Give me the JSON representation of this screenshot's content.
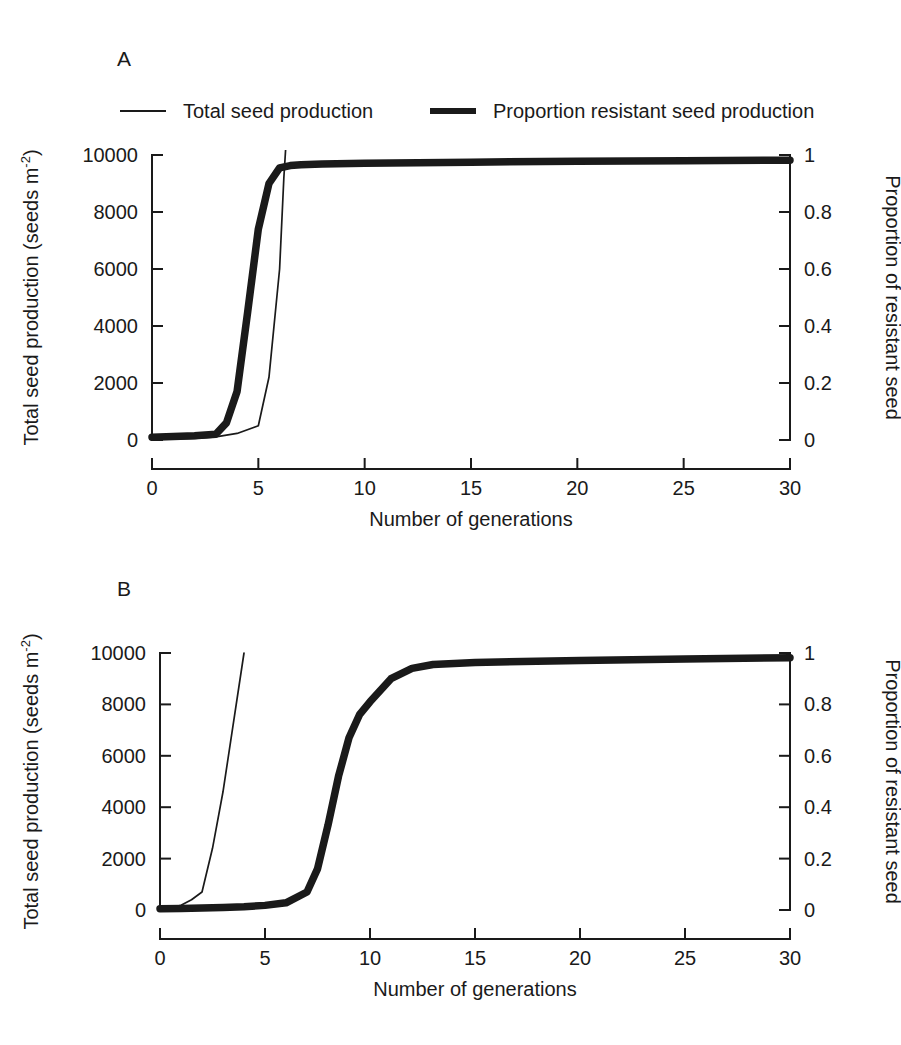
{
  "figure": {
    "panels": [
      {
        "letter": "A"
      },
      {
        "letter": "B"
      }
    ]
  },
  "legend": {
    "position": "top-left",
    "entries": [
      {
        "label": "Total seed production",
        "style": "thin-line",
        "color": "#1a1a1a"
      },
      {
        "label": "Proportion resistant seed production",
        "style": "thick-line",
        "color": "#1a1a1a"
      }
    ]
  },
  "axis_titles": {
    "left": "Total seed production (seeds m",
    "left_sup": "-2",
    "left_close": ")",
    "right": "Proportion of resistant seed",
    "bottom": "Number of generations"
  },
  "ticks": {
    "left": [
      "0",
      "2000",
      "4000",
      "6000",
      "8000",
      "10000"
    ],
    "right": [
      "0",
      "0.2",
      "0.4",
      "0.6",
      "0.8",
      "1"
    ],
    "bottom": [
      "0",
      "5",
      "10",
      "15",
      "20",
      "25",
      "30"
    ]
  },
  "chart_data": [
    {
      "type": "line",
      "panel": "A",
      "title": "A",
      "xlabel": "Number of generations",
      "ylabel": "Total seed production (seeds m-2)",
      "y2label": "Proportion of resistant seed",
      "xlim": [
        0,
        30
      ],
      "ylim": [
        0,
        10000
      ],
      "y2lim": [
        0,
        1
      ],
      "grid": false,
      "legend_position": "above-plot",
      "xticks": [
        0,
        5,
        10,
        15,
        20,
        25,
        30
      ],
      "yticks": [
        0,
        2000,
        4000,
        6000,
        8000,
        10000
      ],
      "y2ticks": [
        0,
        0.2,
        0.4,
        0.6,
        0.8,
        1
      ],
      "series": [
        {
          "name": "Total seed production",
          "axis": "left",
          "style": "thin-line",
          "x": [
            0,
            1,
            2,
            3,
            4,
            5,
            5.5,
            6,
            6.2,
            6.3
          ],
          "values": [
            30,
            40,
            60,
            110,
            230,
            500,
            2200,
            6000,
            9200,
            10400
          ],
          "note": "rises steeply and exits top of plot just after generation 6"
        },
        {
          "name": "Proportion resistant seed production",
          "axis": "right",
          "style": "thick-line",
          "x": [
            0,
            1,
            2,
            3,
            3.5,
            4,
            4.5,
            5,
            5.5,
            6,
            6.5,
            7,
            8,
            10,
            15,
            20,
            25,
            30
          ],
          "values": [
            0.01,
            0.012,
            0.015,
            0.02,
            0.06,
            0.17,
            0.45,
            0.74,
            0.9,
            0.955,
            0.963,
            0.966,
            0.968,
            0.971,
            0.975,
            0.978,
            0.98,
            0.982
          ]
        }
      ]
    },
    {
      "type": "line",
      "panel": "B",
      "title": "B",
      "xlabel": "Number of generations",
      "ylabel": "Total seed production (seeds m-2)",
      "y2label": "Proportion of resistant seed",
      "xlim": [
        0,
        30
      ],
      "ylim": [
        0,
        10000
      ],
      "y2lim": [
        0,
        1
      ],
      "grid": false,
      "legend_position": "none",
      "xticks": [
        0,
        5,
        10,
        15,
        20,
        25,
        30
      ],
      "yticks": [
        0,
        2000,
        4000,
        6000,
        8000,
        10000
      ],
      "y2ticks": [
        0,
        0.2,
        0.4,
        0.6,
        0.8,
        1
      ],
      "series": [
        {
          "name": "Total seed production",
          "axis": "left",
          "style": "thin-line",
          "x": [
            0,
            0.5,
            1,
            1.5,
            2,
            2.5,
            3,
            3.5,
            4
          ],
          "values": [
            30,
            80,
            180,
            400,
            700,
            2400,
            4600,
            7300,
            10000
          ],
          "note": "rises steeply and exits top of plot at about generation 4"
        },
        {
          "name": "Proportion resistant seed production",
          "axis": "right",
          "style": "thick-line",
          "x": [
            0,
            1,
            2,
            3,
            4,
            5,
            6,
            7,
            7.5,
            8,
            8.5,
            9,
            9.5,
            10,
            11,
            12,
            13,
            15,
            20,
            25,
            30
          ],
          "values": [
            0.005,
            0.006,
            0.008,
            0.01,
            0.013,
            0.018,
            0.028,
            0.07,
            0.16,
            0.33,
            0.52,
            0.67,
            0.76,
            0.81,
            0.9,
            0.94,
            0.955,
            0.963,
            0.971,
            0.977,
            0.982
          ]
        }
      ]
    }
  ]
}
